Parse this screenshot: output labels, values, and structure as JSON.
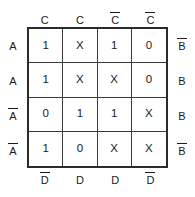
{
  "chart_data": {
    "type": "table",
    "title": "",
    "xlabel": "",
    "ylabel": "",
    "grid": true,
    "legend": "none",
    "map_kind": "karnaugh-map",
    "variables": [
      "A",
      "B",
      "C",
      "D"
    ],
    "rows": 4,
    "columns": 4,
    "column_headers_top": [
      {
        "text": "C",
        "negated": false
      },
      {
        "text": "C",
        "negated": false
      },
      {
        "text": "C",
        "negated": true
      },
      {
        "text": "C",
        "negated": true
      }
    ],
    "column_headers_bottom": [
      {
        "text": "D",
        "negated": true
      },
      {
        "text": "D",
        "negated": false
      },
      {
        "text": "D",
        "negated": false
      },
      {
        "text": "D",
        "negated": true
      }
    ],
    "row_headers_left": [
      {
        "text": "A",
        "negated": false
      },
      {
        "text": "A",
        "negated": false
      },
      {
        "text": "A",
        "negated": true
      },
      {
        "text": "A",
        "negated": true
      }
    ],
    "row_headers_right": [
      {
        "text": "B",
        "negated": true
      },
      {
        "text": "B",
        "negated": false
      },
      {
        "text": "B",
        "negated": false
      },
      {
        "text": "B",
        "negated": true
      }
    ],
    "cells": [
      [
        "1",
        "X",
        "1",
        "0"
      ],
      [
        "1",
        "X",
        "X",
        "0"
      ],
      [
        "0",
        "1",
        "1",
        "X"
      ],
      [
        "1",
        "0",
        "X",
        "X"
      ]
    ],
    "colors": {
      "background": "#ffffff",
      "outer_border": "#2b2b2b",
      "inner_line": "#3a3a3a",
      "text": "#1a1a1a"
    }
  }
}
